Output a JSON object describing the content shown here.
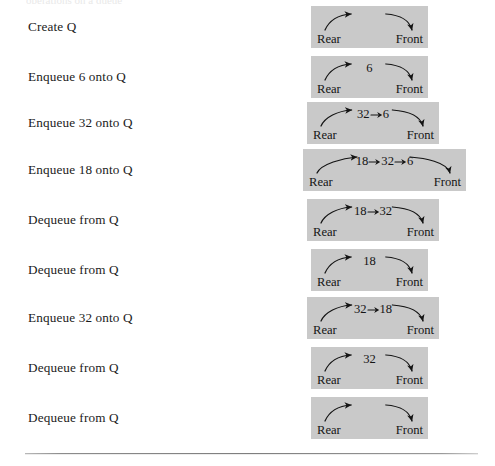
{
  "figure": {
    "top_cut_text": "operations on a queue",
    "end_labels": {
      "rear": "Rear",
      "front": "Front"
    },
    "arrow_icon": "arrow-right-icon",
    "panel_color": "#c9c9c9",
    "rule_color": "#7e7e7e",
    "rows": [
      {
        "operation": "Create Q",
        "items": [],
        "panel": {
          "left": 311,
          "width": 117,
          "top": 8
        },
        "arc": {
          "peak": 0.46
        }
      },
      {
        "operation": "Enqueue 6 onto Q",
        "items": [
          "6"
        ],
        "panel": {
          "left": 311,
          "width": 117,
          "top": 58
        },
        "arc": {
          "peak": 0.46
        }
      },
      {
        "operation": "Enqueue 32 onto Q",
        "items": [
          "32",
          "6"
        ],
        "panel": {
          "left": 307,
          "width": 132,
          "top": 104
        },
        "arc": {
          "peak": 0.46
        }
      },
      {
        "operation": "Enqueue 18 onto Q",
        "items": [
          "18",
          "32",
          "6"
        ],
        "panel": {
          "left": 303,
          "width": 163,
          "top": 151
        },
        "arc": {
          "peak": 0.46
        }
      },
      {
        "operation": "Dequeue from Q",
        "items": [
          "18",
          "32"
        ],
        "panel": {
          "left": 307,
          "width": 132,
          "top": 201
        },
        "arc": {
          "peak": 0.46
        }
      },
      {
        "operation": "Dequeue from Q",
        "items": [
          "18"
        ],
        "panel": {
          "left": 311,
          "width": 117,
          "top": 251
        },
        "arc": {
          "peak": 0.46
        }
      },
      {
        "operation": "Enqueue 32 onto Q",
        "items": [
          "32",
          "18"
        ],
        "panel": {
          "left": 307,
          "width": 132,
          "top": 299
        },
        "arc": {
          "peak": 0.46
        }
      },
      {
        "operation": "Dequeue from Q",
        "items": [
          "32"
        ],
        "panel": {
          "left": 311,
          "width": 117,
          "top": 349
        },
        "arc": {
          "peak": 0.46
        }
      },
      {
        "operation": "Dequeue from Q",
        "items": [],
        "panel": {
          "left": 311,
          "width": 117,
          "top": 399
        },
        "arc": {
          "peak": 0.46
        }
      }
    ]
  }
}
